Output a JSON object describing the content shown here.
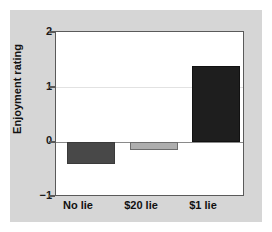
{
  "chart_data": {
    "type": "bar",
    "title": "",
    "xlabel": "",
    "ylabel": "Enjoyment rating",
    "categories": [
      "No lie",
      "$20 lie",
      "$1 lie"
    ],
    "values": [
      -0.4,
      -0.15,
      1.38
    ],
    "bar_colors": [
      "#484848",
      "#aeaeae",
      "#1e1e1e"
    ],
    "ylim": [
      -1,
      2
    ],
    "yticks": [
      "2",
      "1",
      "0",
      "−1"
    ],
    "ytick_values": [
      2,
      1,
      0,
      -1
    ],
    "grid": "horizontal-faint",
    "legend": "none",
    "zero_line": true
  },
  "figure": {
    "panel_color": "#d6d6d6",
    "plot_background": "#ffffff",
    "frame_color": "#5a5a5a",
    "gridline_color": "#e2e2e2",
    "zeroline_color": "#8a8a8a"
  }
}
